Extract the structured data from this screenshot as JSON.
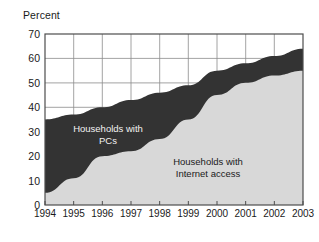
{
  "chart_data": {
    "type": "area",
    "title": "",
    "subtitle": "",
    "xlabel": "",
    "ylabel": "Percent",
    "ylim": [
      0,
      70
    ],
    "ytick_step": 10,
    "grid": true,
    "legend_position": "inline-annotations",
    "stacked": false,
    "categories": [
      "1994",
      "1995",
      "1996",
      "1997",
      "1998",
      "1999",
      "2000",
      "2001",
      "2002",
      "2003"
    ],
    "x": [
      1994,
      1995,
      1996,
      1997,
      1998,
      1999,
      2000,
      2001,
      2002,
      2003
    ],
    "yticks": [
      0,
      10,
      20,
      30,
      40,
      50,
      60,
      70
    ],
    "series": [
      {
        "name": "Households with PCs",
        "color": "#333333",
        "values": [
          35,
          37,
          40,
          43,
          46,
          49,
          55,
          58,
          61,
          64
        ]
      },
      {
        "name": "Households with Internet access",
        "color": "#d8d8d8",
        "values": [
          5,
          11,
          20,
          22,
          27,
          35,
          45,
          50,
          53,
          55
        ]
      }
    ],
    "annotations": [
      {
        "id": "pcs",
        "lines": [
          "Households with",
          "PCs"
        ],
        "color": "#f2f2f2"
      },
      {
        "id": "internet",
        "lines": [
          "Households with",
          "Internet access"
        ],
        "color": "#1a1a1a"
      }
    ]
  },
  "axis": {
    "y_title": "Percent",
    "y_labels": [
      "70",
      "60",
      "50",
      "40",
      "30",
      "20",
      "10",
      "0"
    ],
    "x_labels": [
      "1994",
      "1995",
      "1996",
      "1997",
      "1998",
      "1999",
      "2000",
      "2001",
      "2002",
      "2003"
    ]
  },
  "annotations": {
    "pcs_line1": "Households with",
    "pcs_line2": "PCs",
    "internet_line1": "Households with",
    "internet_line2": "Internet access"
  },
  "colors": {
    "pcs_area": "#333333",
    "internet_area": "#d8d8d8",
    "grid": "#8c8c8c",
    "axis": "#4d4d4d",
    "text": "#1a1a1a"
  }
}
